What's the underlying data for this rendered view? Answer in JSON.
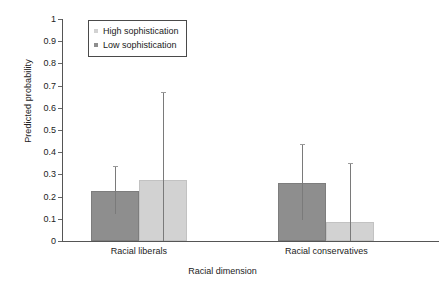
{
  "chart_data": {
    "type": "bar",
    "title": "",
    "subtitle": "",
    "xlabel": "Racial dimension",
    "ylabel": "Predicted probability",
    "categories": [
      "Racial liberals",
      "Racial conservatives"
    ],
    "ylim": [
      0,
      1
    ],
    "ytick_labels": [
      "1",
      "0.9",
      "0.8",
      "0.7",
      "0.6",
      "0.5",
      "0.4",
      "0.3",
      "0.2",
      "0.1",
      "0"
    ],
    "ytick_values": [
      1,
      0.9,
      0.8,
      0.7,
      0.6,
      0.5,
      0.4,
      0.3,
      0.2,
      0.1,
      0
    ],
    "grid": false,
    "legend_position": "top-left-inside",
    "series": [
      {
        "name": "Low sophistication",
        "color": "#8e8e8e",
        "values": [
          0.225,
          0.26
        ],
        "error_low": [
          0.12,
          0.095
        ],
        "error_high": [
          0.34,
          0.435
        ]
      },
      {
        "name": "High sophistication",
        "color": "#d2d2d2",
        "values": [
          0.275,
          0.085
        ],
        "error_low": [
          0.0,
          0.0
        ],
        "error_high": [
          0.67,
          0.35
        ]
      }
    ],
    "bar_draw_order": [
      "Low sophistication",
      "High sophistication"
    ],
    "legend_entries": [
      {
        "label": "High sophistication",
        "color": "#d2d2d2"
      },
      {
        "label": "Low sophistication",
        "color": "#8e8e8e"
      }
    ],
    "annotations": []
  },
  "axes": {
    "y_title": "Predicted probability",
    "x_title": "Racial dimension"
  }
}
